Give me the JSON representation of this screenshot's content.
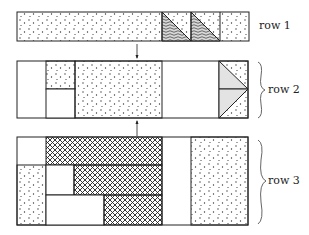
{
  "rows": [
    {
      "label": "row 1"
    },
    {
      "label": "row 2"
    },
    {
      "label": "row 3"
    }
  ],
  "colors": {
    "line": "#222222",
    "dot": "#333333",
    "gray_fill": "#e3e3e3",
    "background": "#ffffff"
  }
}
